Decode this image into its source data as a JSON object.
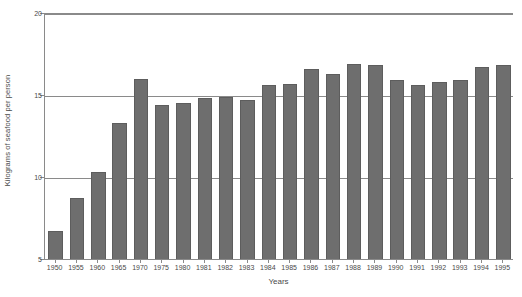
{
  "chart_data": {
    "type": "bar",
    "title": "",
    "xlabel": "Years",
    "ylabel": "Kilograms of seafood per person",
    "categories": [
      "1950",
      "1955",
      "1960",
      "1965",
      "1970",
      "1975",
      "1980",
      "1981",
      "1982",
      "1983",
      "1984",
      "1985",
      "1986",
      "1987",
      "1988",
      "1989",
      "1990",
      "1991",
      "1992",
      "1993",
      "1994",
      "1995"
    ],
    "values": [
      6.7,
      8.7,
      10.3,
      13.3,
      16.0,
      14.4,
      14.5,
      14.8,
      14.9,
      14.7,
      15.6,
      15.7,
      16.6,
      16.3,
      16.9,
      16.8,
      15.9,
      15.6,
      15.8,
      15.9,
      16.7,
      16.8
    ],
    "ylim": [
      5,
      20
    ],
    "yticks": [
      5,
      10,
      15,
      20
    ],
    "ytick_labels": [
      "5",
      "10",
      "15",
      "20"
    ],
    "grid": "horizontal",
    "legend": "none",
    "bar_color": "#6e6e6e",
    "axis_color": "#8a8a8a",
    "background": "#ffffff"
  }
}
